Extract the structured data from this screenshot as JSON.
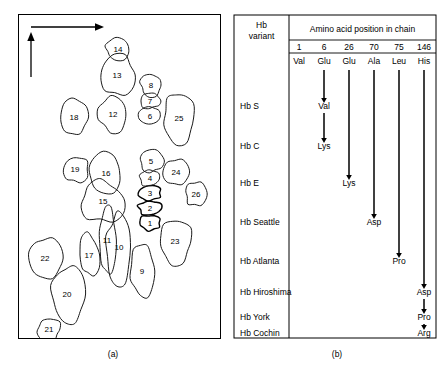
{
  "figure": {
    "caption_a": "(a)",
    "caption_b": "(b)"
  },
  "panel_a": {
    "title": "two-dimensional gel electrophoresis map of hemoglobin peptides",
    "axes": {
      "horizontal_arrow": "horizontal-axis-arrow",
      "vertical_arrow": "vertical-axis-arrow"
    },
    "spots": [
      {
        "id": "1",
        "label": "1",
        "cx": 131,
        "cy": 208,
        "rx": 11,
        "ry": 8,
        "dark": true
      },
      {
        "id": "2",
        "label": "2",
        "cx": 131,
        "cy": 193,
        "rx": 12,
        "ry": 8,
        "dark": true
      },
      {
        "id": "3",
        "label": "3",
        "cx": 131,
        "cy": 178,
        "rx": 12,
        "ry": 8,
        "dark": true
      },
      {
        "id": "4",
        "label": "4",
        "cx": 131,
        "cy": 163,
        "rx": 10,
        "ry": 9,
        "dark": false
      },
      {
        "id": "5",
        "label": "5",
        "cx": 132,
        "cy": 146,
        "rx": 12,
        "ry": 12,
        "dark": false
      },
      {
        "id": "6",
        "label": "6",
        "cx": 131,
        "cy": 101,
        "rx": 11,
        "ry": 10,
        "dark": false
      },
      {
        "id": "7",
        "label": "7",
        "cx": 131,
        "cy": 86,
        "rx": 10,
        "ry": 8,
        "dark": false
      },
      {
        "id": "8",
        "label": "8",
        "cx": 132,
        "cy": 70,
        "rx": 11,
        "ry": 11,
        "dark": false
      },
      {
        "id": "9",
        "label": "9",
        "cx": 123,
        "cy": 256,
        "rx": 12,
        "ry": 26,
        "dark": false
      },
      {
        "id": "10",
        "label": "10",
        "cx": 100,
        "cy": 232,
        "rx": 13,
        "ry": 36,
        "dark": false
      },
      {
        "id": "11",
        "label": "11",
        "cx": 88,
        "cy": 225,
        "rx": 9,
        "ry": 33,
        "dark": false
      },
      {
        "id": "12",
        "label": "12",
        "cx": 94,
        "cy": 99,
        "rx": 15,
        "ry": 18,
        "dark": false
      },
      {
        "id": "13",
        "label": "13",
        "cx": 98,
        "cy": 60,
        "rx": 18,
        "ry": 20,
        "dark": false
      },
      {
        "id": "14",
        "label": "14",
        "cx": 99,
        "cy": 34,
        "rx": 13,
        "ry": 11,
        "dark": false
      },
      {
        "id": "15",
        "label": "15",
        "cx": 84,
        "cy": 186,
        "rx": 22,
        "ry": 21,
        "dark": false
      },
      {
        "id": "16",
        "label": "16",
        "cx": 87,
        "cy": 158,
        "rx": 17,
        "ry": 20,
        "dark": false
      },
      {
        "id": "17",
        "label": "17",
        "cx": 70,
        "cy": 240,
        "rx": 11,
        "ry": 21,
        "dark": false
      },
      {
        "id": "18",
        "label": "18",
        "cx": 55,
        "cy": 102,
        "rx": 13,
        "ry": 17,
        "dark": false
      },
      {
        "id": "19",
        "label": "19",
        "cx": 56,
        "cy": 154,
        "rx": 13,
        "ry": 14,
        "dark": false
      },
      {
        "id": "20",
        "label": "20",
        "cx": 48,
        "cy": 279,
        "rx": 17,
        "ry": 30,
        "dark": false
      },
      {
        "id": "21",
        "label": "21",
        "cx": 30,
        "cy": 314,
        "rx": 12,
        "ry": 12,
        "dark": false
      },
      {
        "id": "22",
        "label": "22",
        "cx": 26,
        "cy": 243,
        "rx": 17,
        "ry": 21,
        "dark": false
      },
      {
        "id": "23",
        "label": "23",
        "cx": 156,
        "cy": 226,
        "rx": 18,
        "ry": 23,
        "dark": false
      },
      {
        "id": "24",
        "label": "24",
        "cx": 157,
        "cy": 157,
        "rx": 13,
        "ry": 13,
        "dark": false
      },
      {
        "id": "25",
        "label": "25",
        "cx": 160,
        "cy": 103,
        "rx": 17,
        "ry": 26,
        "dark": false
      },
      {
        "id": "26",
        "label": "26",
        "cx": 177,
        "cy": 179,
        "rx": 11,
        "ry": 12,
        "dark": false
      }
    ]
  },
  "panel_b": {
    "row_header": {
      "line1": "Hb",
      "line2": "variant"
    },
    "column_group_header": "Amino acid position in chain",
    "positions": [
      "1",
      "6",
      "26",
      "70",
      "75",
      "146"
    ],
    "wild_type_residues": [
      "Val",
      "Glu",
      "Glu",
      "Ala",
      "Leu",
      "His"
    ],
    "variants": [
      "Hb S",
      "Hb C",
      "Hb E",
      "Hb Seattle",
      "Hb Atlanta",
      "Hb Hiroshima",
      "Hb York",
      "Hb Cochin"
    ],
    "substitutions": [
      {
        "variant": "Hb S",
        "position": "6",
        "residue": "Val"
      },
      {
        "variant": "Hb C",
        "position": "6",
        "residue": "Lys"
      },
      {
        "variant": "Hb E",
        "position": "26",
        "residue": "Lys"
      },
      {
        "variant": "Hb Seattle",
        "position": "70",
        "residue": "Asp"
      },
      {
        "variant": "Hb Atlanta",
        "position": "75",
        "residue": "Pro"
      },
      {
        "variant": "Hb Hiroshima",
        "position": "146",
        "residue": "Asp"
      },
      {
        "variant": "Hb York",
        "position": "146",
        "residue": "Pro"
      },
      {
        "variant": "Hb Cochin",
        "position": "146",
        "residue": "Arg"
      }
    ]
  }
}
